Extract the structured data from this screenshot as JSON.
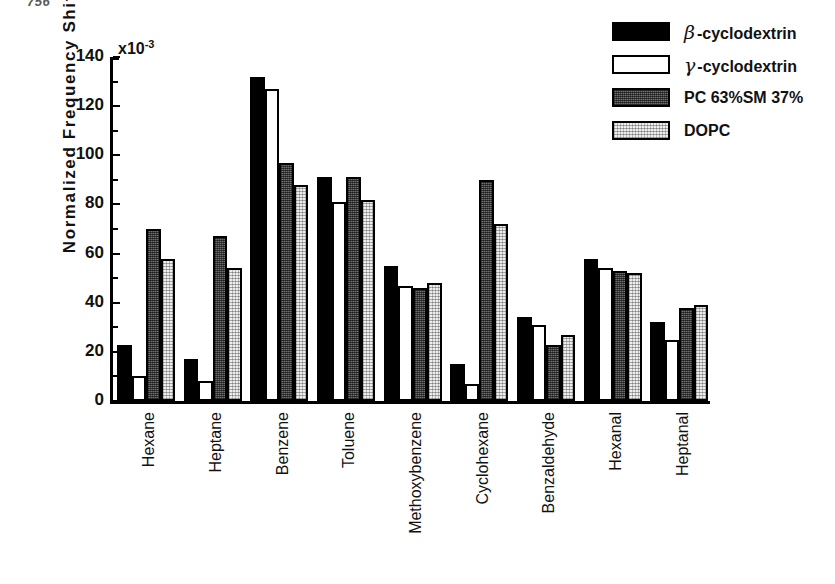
{
  "folio": "756",
  "exponent": {
    "base": "x10",
    "power": "-3"
  },
  "axes": {
    "ylabel": "Normalized Frequency Shift",
    "yticks": [
      0,
      20,
      40,
      60,
      80,
      100,
      120,
      140
    ],
    "ylim": [
      0,
      140
    ]
  },
  "legend": {
    "position": "top-right",
    "entries": [
      {
        "greek": "β",
        "label": "-cyclodextrin",
        "swatch": "solid-black",
        "color": "#000000"
      },
      {
        "greek": "γ",
        "label": "-cyclodextrin",
        "swatch": "open-white",
        "color": "#ffffff"
      },
      {
        "greek": "",
        "label": "PC 63%SM 37%",
        "swatch": "dark-gray-hatch",
        "color": "#6f6f6f"
      },
      {
        "greek": "",
        "label": "DOPC",
        "swatch": "light-gray-hatch",
        "color": "#ededed"
      }
    ]
  },
  "chart_data": {
    "type": "bar",
    "title": "",
    "xlabel": "",
    "ylabel": "Normalized Frequency Shift",
    "y_scale_note": "x10^-3",
    "ylim": [
      0,
      140
    ],
    "yticks": [
      0,
      20,
      40,
      60,
      80,
      100,
      120,
      140
    ],
    "grid": false,
    "legend_position": "top-right",
    "categories": [
      "Hexane",
      "Heptane",
      "Benzene",
      "Toluene",
      "Methoxybenzene",
      "Cyclohexane",
      "Benzaldehyde",
      "Hexanal",
      "Heptanal"
    ],
    "series": [
      {
        "name": "β-cyclodextrin",
        "color": "#000000",
        "values": [
          23,
          17,
          132,
          91,
          55,
          15,
          34,
          58,
          32
        ]
      },
      {
        "name": "γ-cyclodextrin",
        "color": "#ffffff",
        "values": [
          10,
          8,
          127,
          81,
          47,
          7,
          31,
          54,
          25
        ]
      },
      {
        "name": "PC 63%SM 37%",
        "color": "#6f6f6f",
        "values": [
          70,
          67,
          97,
          91,
          46,
          90,
          23,
          53,
          38
        ]
      },
      {
        "name": "DOPC",
        "color": "#ededed",
        "values": [
          58,
          54,
          88,
          82,
          48,
          72,
          27,
          52,
          39
        ]
      }
    ]
  }
}
